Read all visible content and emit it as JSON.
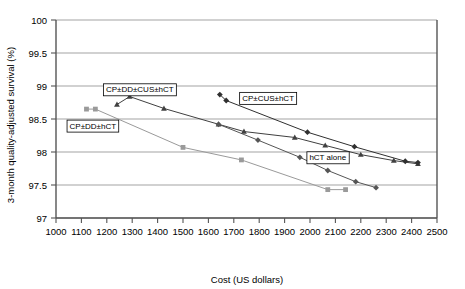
{
  "chart_data": {
    "type": "line",
    "title": "",
    "xlabel": "Cost (US dollars)",
    "ylabel": "3-month quality-adjusted survival (%)",
    "xlim": [
      1000,
      2500
    ],
    "ylim": [
      97,
      100
    ],
    "xticks": [
      1000,
      1100,
      1200,
      1300,
      1400,
      1500,
      1600,
      1700,
      1800,
      1900,
      2000,
      2100,
      2200,
      2300,
      2400,
      2500
    ],
    "yticks": [
      97,
      97.5,
      98,
      98.5,
      99,
      99.5,
      100
    ],
    "xtick_labels": [
      "1000",
      "1100",
      "1200",
      "1300",
      "1400",
      "1500",
      "1600",
      "1700",
      "1800",
      "1900",
      "2000",
      "2100",
      "2200",
      "2300",
      "2400",
      "2500"
    ],
    "ytick_labels": [
      "97",
      "97.5",
      "98",
      "98.5",
      "99",
      "99.5",
      "100"
    ],
    "grid": "horizontal",
    "legend_position": "inline-annotations",
    "series": [
      {
        "name": "CP±DD±CUS±hCT",
        "marker": "triangle",
        "color": "#404040",
        "label_x": 1330,
        "label_y": 98.95,
        "points": [
          {
            "x": 1240,
            "y": 98.72
          },
          {
            "x": 1290,
            "y": 98.84
          },
          {
            "x": 1425,
            "y": 98.66
          },
          {
            "x": 1640,
            "y": 98.42
          },
          {
            "x": 1740,
            "y": 98.31
          },
          {
            "x": 1940,
            "y": 98.22
          },
          {
            "x": 2060,
            "y": 98.1
          },
          {
            "x": 2200,
            "y": 97.96
          },
          {
            "x": 2330,
            "y": 97.87
          },
          {
            "x": 2425,
            "y": 97.82
          }
        ]
      },
      {
        "name": "CP±CUS±hCT",
        "marker": "diamond",
        "color": "#303030",
        "label_x": 1835,
        "label_y": 98.82,
        "points": [
          {
            "x": 1645,
            "y": 98.87
          },
          {
            "x": 1670,
            "y": 98.78
          },
          {
            "x": 1990,
            "y": 98.3
          },
          {
            "x": 2175,
            "y": 98.08
          },
          {
            "x": 2375,
            "y": 97.86
          },
          {
            "x": 2425,
            "y": 97.84
          }
        ]
      },
      {
        "name": "hCT alone",
        "marker": "diamond",
        "color": "#555555",
        "label_x": 2070,
        "label_y": 97.92,
        "points": [
          {
            "x": 1640,
            "y": 98.42
          },
          {
            "x": 1795,
            "y": 98.18
          },
          {
            "x": 1960,
            "y": 97.92
          },
          {
            "x": 2070,
            "y": 97.72
          },
          {
            "x": 2180,
            "y": 97.55
          },
          {
            "x": 2260,
            "y": 97.46
          }
        ]
      },
      {
        "name": "CP±DD±hCT",
        "marker": "square",
        "color": "#9a9a9a",
        "label_x": 1145,
        "label_y": 98.4,
        "points": [
          {
            "x": 1120,
            "y": 98.65
          },
          {
            "x": 1155,
            "y": 98.65
          },
          {
            "x": 1500,
            "y": 98.07
          },
          {
            "x": 1730,
            "y": 97.88
          },
          {
            "x": 2070,
            "y": 97.43
          },
          {
            "x": 2140,
            "y": 97.43
          }
        ]
      }
    ]
  }
}
